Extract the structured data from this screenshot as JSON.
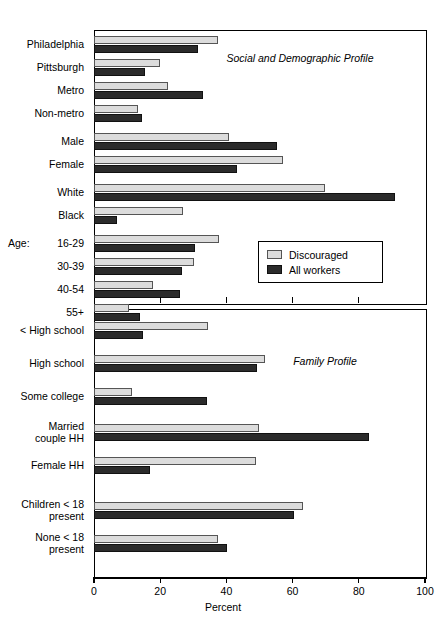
{
  "chart_data": {
    "type": "bar",
    "orientation": "horizontal",
    "title": "",
    "xlabel": "Percent",
    "ylabel": "",
    "xlim": [
      0,
      100
    ],
    "xticks": [
      0,
      20,
      40,
      60,
      80,
      100
    ],
    "grid": false,
    "legend": {
      "position": "middle-right of upper panel",
      "entries": [
        {
          "name": "Discouraged",
          "color": "#dcdcdc"
        },
        {
          "name": "All workers",
          "color": "#2b2b2b"
        }
      ]
    },
    "series": [
      {
        "name": "Discouraged",
        "color": "#dcdcdc"
      },
      {
        "name": "All workers",
        "color": "#2b2b2b"
      }
    ],
    "panels": [
      {
        "note": "Social and Demographic Profile",
        "categories": [
          {
            "label": "Philadelphia",
            "discouraged": 37.5,
            "all_workers": 31.4
          },
          {
            "label": "Pittsburgh",
            "discouraged": 20.0,
            "all_workers": 15.4
          },
          {
            "label": "Metro",
            "discouraged": 22.4,
            "all_workers": 33.0
          },
          {
            "label": "Non-metro",
            "discouraged": 13.3,
            "all_workers": 14.5
          },
          {
            "label": "Male",
            "discouraged": 40.8,
            "all_workers": 55.3
          },
          {
            "label": "Female",
            "discouraged": 57.1,
            "all_workers": 43.2
          },
          {
            "label": "White",
            "discouraged": 69.8,
            "all_workers": 91.0
          },
          {
            "label": "Black",
            "discouraged": 27.0,
            "all_workers": 7.0
          },
          {
            "label": "16-29",
            "prefix": "Age:",
            "discouraged": 37.8,
            "all_workers": 30.5
          },
          {
            "label": "30-39",
            "discouraged": 30.2,
            "all_workers": 26.6
          },
          {
            "label": "40-54",
            "discouraged": 17.8,
            "all_workers": 26.0
          },
          {
            "label": "55+",
            "discouraged": 10.6,
            "all_workers": 13.9
          }
        ]
      },
      {
        "note": "Family Profile",
        "categories": [
          {
            "label": "< High school",
            "discouraged": 34.5,
            "all_workers": 14.9
          },
          {
            "label": "High school",
            "discouraged": 51.7,
            "all_workers": 49.2
          },
          {
            "label": "Some college",
            "discouraged": 11.4,
            "all_workers": 34.1
          },
          {
            "label": "Married couple  HH",
            "discouraged": 49.8,
            "all_workers": 83.1
          },
          {
            "label": "Female  HH",
            "discouraged": 48.9,
            "all_workers": 16.9
          },
          {
            "label": "Children < 18 present",
            "discouraged": 63.1,
            "all_workers": 60.4
          },
          {
            "label": "None < 18 present",
            "discouraged": 37.5,
            "all_workers": 40.2
          }
        ]
      }
    ]
  },
  "axis": {
    "x_title": "Percent",
    "tick_labels": [
      "0",
      "20",
      "40",
      "60",
      "80",
      "100"
    ]
  },
  "annotations": {
    "top_panel_note": "Social and Demographic Profile",
    "bottom_panel_note": "Family Profile"
  },
  "legend": {
    "discouraged_label": "Discouraged",
    "all_workers_label": "All workers"
  },
  "ylabels_top": [
    {
      "text": "Philadelphia"
    },
    {
      "text": "Pittsburgh"
    },
    {
      "text": "Metro"
    },
    {
      "text": "Non-metro"
    },
    {
      "text": "Male"
    },
    {
      "text": "Female"
    },
    {
      "text": "White"
    },
    {
      "text": "Black"
    },
    {
      "text": "16-29",
      "prefix": "Age:"
    },
    {
      "text": "30-39"
    },
    {
      "text": "40-54"
    },
    {
      "text": "55+"
    }
  ],
  "ylabels_bottom": [
    {
      "text": "< High school"
    },
    {
      "text": "High school"
    },
    {
      "text": "Some college"
    },
    {
      "text": "Married\ncouple  HH"
    },
    {
      "text": "Female  HH"
    },
    {
      "text": "Children < 18\npresent"
    },
    {
      "text": "None < 18\npresent"
    }
  ]
}
